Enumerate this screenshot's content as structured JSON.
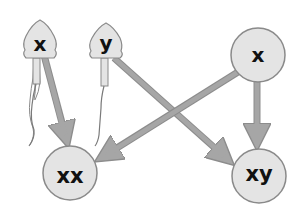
{
  "diagram": {
    "title": "",
    "colors": {
      "background": "#ffffff",
      "cell_fill": "#e4e4e4",
      "cell_stroke": "#8a8a8a",
      "arrow": "#a6a6a6",
      "arrow_edge": "#8c8c8c",
      "label": "#111111"
    },
    "nodes": [
      {
        "id": "sperm_x",
        "type": "sperm",
        "label": "x"
      },
      {
        "id": "sperm_y",
        "type": "sperm",
        "label": "y"
      },
      {
        "id": "egg_x",
        "type": "egg",
        "label": "x"
      },
      {
        "id": "child_xx",
        "type": "zygote",
        "label": "xx"
      },
      {
        "id": "child_xy",
        "type": "zygote",
        "label": "xy"
      }
    ],
    "edges": [
      {
        "from": "sperm_x",
        "to": "child_xx"
      },
      {
        "from": "sperm_y",
        "to": "child_xy"
      },
      {
        "from": "egg_x",
        "to": "child_xx"
      },
      {
        "from": "egg_x",
        "to": "child_xy"
      }
    ]
  }
}
